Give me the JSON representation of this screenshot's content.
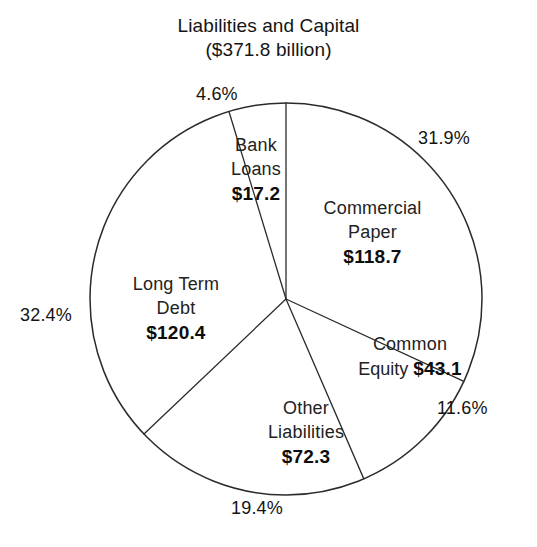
{
  "title": {
    "line1": "Liabilities and Capital",
    "line2": "($371.8 billion)"
  },
  "chart_data": {
    "type": "pie",
    "title": "Liabilities and Capital ($371.8 billion)",
    "total_label": "($371.8 billion)",
    "total_value": 371.8,
    "units": "billions of dollars",
    "legend": "none",
    "grid": false,
    "start_angle_deg": 0,
    "direction": "clockwise",
    "categories": [
      "Commercial Paper",
      "Common Equity",
      "Other Liabilities",
      "Long Term Debt",
      "Bank Loans"
    ],
    "values": [
      118.7,
      43.1,
      72.3,
      120.4,
      17.2
    ],
    "percentages": [
      31.9,
      11.6,
      19.4,
      32.4,
      4.6
    ],
    "slices": [
      {
        "name_line1": "Commercial",
        "name_line2": "Paper",
        "value_label": "$118.7",
        "pct_label": "31.9%",
        "value": 118.7,
        "percent": 31.9
      },
      {
        "name_line1": "Common",
        "name_line2": "Equity",
        "value_label": "$43.1",
        "pct_label": "11.6%",
        "value": 43.1,
        "percent": 11.6
      },
      {
        "name_line1": "Other",
        "name_line2": "Liabilities",
        "value_label": "$72.3",
        "pct_label": "19.4%",
        "value": 72.3,
        "percent": 19.4
      },
      {
        "name_line1": "Long Term",
        "name_line2": "Debt",
        "value_label": "$120.4",
        "pct_label": "32.4%",
        "value": 120.4,
        "percent": 32.4
      },
      {
        "name_line1": "Bank",
        "name_line2": "Loans",
        "value_label": "$17.2",
        "pct_label": "4.6%",
        "value": 17.2,
        "percent": 4.6
      }
    ]
  },
  "colors": {
    "background": "#ffffff",
    "outline": "#2b2b2b",
    "text": "#141414"
  }
}
